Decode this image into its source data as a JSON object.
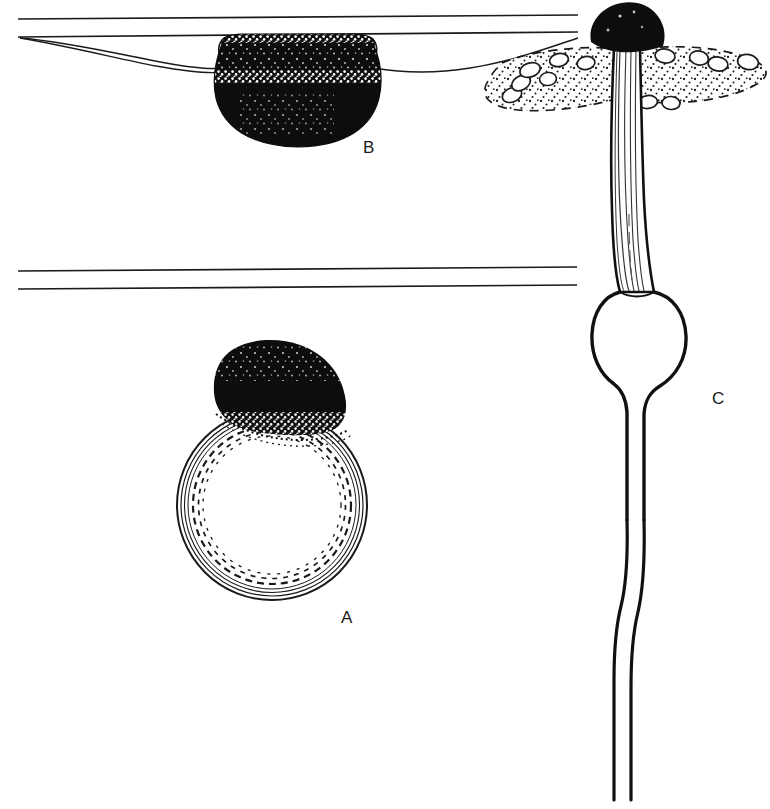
{
  "figure": {
    "background_color": "#ffffff",
    "ink_color": "#111111",
    "stipple_color": "#1a1a1a",
    "width": 770,
    "height": 809
  },
  "labels": [
    {
      "id": "A",
      "text": "A",
      "x": 341,
      "y": 609,
      "refers_to": "detached-sporangium-with-vesicle"
    },
    {
      "id": "B",
      "text": "B",
      "x": 363,
      "y": 139,
      "refers_to": "sporangium-adhering-to-surface"
    },
    {
      "id": "C",
      "text": "C",
      "x": 712,
      "y": 390,
      "refers_to": "sporangiophore-with-trophocyst"
    }
  ],
  "parts": {
    "a": {
      "name": "detached sporangium with subsporangial vesicle",
      "vesicle": "large clear sphere drawn with concentric solid and dashed outlines",
      "sporangium": "solid black dome resting on top of the vesicle",
      "center_x": 272,
      "center_y": 505,
      "radius": 95
    },
    "b": {
      "name": "sporangium adhering to the underside of a surface",
      "sporangium": "solid black rounded mass hanging below a long wavy adhesive film",
      "collar": "pale stippled band across the upper portion of the black mass",
      "surface_lines": "two long horizontal reference lines above",
      "center_x": 297,
      "center_y": 86
    },
    "c": {
      "name": "sporangiophore with black sporangium, substrate and trophocyst",
      "sporangium": "solid black hemispherical cap at the top",
      "substrate": "stippled dung mass with dashed margin containing small oval cells",
      "stalk": "long tapering striated sporangiophore stalk",
      "trophocyst": "swollen bulbous vesicle below the substrate",
      "hypha": "pair of thin wavy lines continuing to the bottom edge",
      "cap_center_x": 626,
      "cap_center_y": 33
    }
  },
  "reference_lines": {
    "upper": [
      {
        "x1": 18,
        "y1": 19,
        "x2": 578,
        "y2": 15
      },
      {
        "x1": 18,
        "y1": 37,
        "x2": 578,
        "y2": 32
      }
    ],
    "lower": [
      {
        "x1": 18,
        "y1": 271,
        "x2": 577,
        "y2": 267
      },
      {
        "x1": 18,
        "y1": 289,
        "x2": 577,
        "y2": 285
      }
    ]
  }
}
